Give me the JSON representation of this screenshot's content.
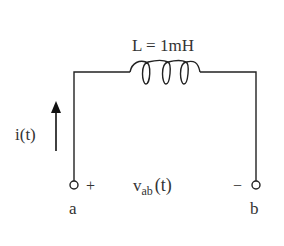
{
  "diagram": {
    "type": "circuit",
    "inductor": {
      "label": "L = 1mH",
      "symbol": "L",
      "value": "1mH",
      "loops": 3
    },
    "current": {
      "label": "i(t)",
      "direction": "up"
    },
    "voltage": {
      "prefix": "v",
      "subscript": "ab",
      "suffix": "(t)"
    },
    "terminal_a": {
      "label": "a",
      "polarity": "+"
    },
    "terminal_b": {
      "label": "b",
      "polarity": "−"
    },
    "colors": {
      "wire": "#222222",
      "text": "#333333",
      "background": "#ffffff"
    }
  }
}
